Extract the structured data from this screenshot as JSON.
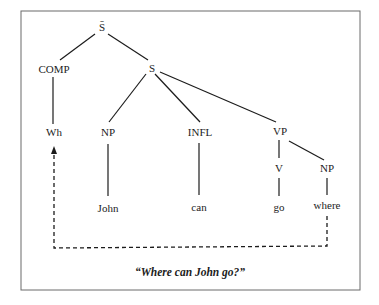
{
  "diagram": {
    "type": "syntax-tree",
    "caption": "“Where can John go?”",
    "nodes": {
      "sbar": "S̄",
      "comp": "COMP",
      "s": "S",
      "wh": "Wh",
      "np_subj": "NP",
      "infl": "INFL",
      "vp": "VP",
      "v": "V",
      "np_obj": "NP",
      "john": "John",
      "can": "can",
      "go": "go",
      "where": "where"
    },
    "edges": [
      [
        "S̄",
        "COMP"
      ],
      [
        "S̄",
        "S"
      ],
      [
        "COMP",
        "Wh"
      ],
      [
        "S",
        "NP"
      ],
      [
        "S",
        "INFL"
      ],
      [
        "S",
        "VP"
      ],
      [
        "NP",
        "John"
      ],
      [
        "INFL",
        "can"
      ],
      [
        "VP",
        "V"
      ],
      [
        "VP",
        "NP"
      ],
      [
        "V",
        "go"
      ],
      [
        "NP",
        "where"
      ]
    ],
    "movement": {
      "from": "where",
      "to": "Wh",
      "style": "dashed-arrow"
    },
    "colors": {
      "ink": "#1c1c1c",
      "frame": "#6a6a6a",
      "background": "#ffffff"
    }
  }
}
